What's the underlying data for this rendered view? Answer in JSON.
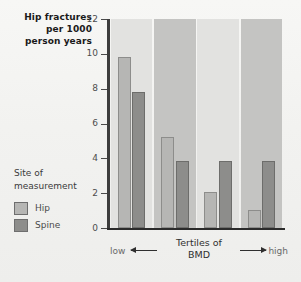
{
  "chart_data": {
    "type": "bar",
    "title": "Hip fractures per 1000 person years",
    "title_lines": [
      "Hip fractures",
      "per 1000",
      "person years"
    ],
    "categories": [
      "1",
      "2",
      "3",
      "4"
    ],
    "series": [
      {
        "name": "Hip",
        "values": [
          9.8,
          5.2,
          2.05,
          1.05
        ],
        "color": "#b6b6b4"
      },
      {
        "name": "Spine",
        "values": [
          7.8,
          3.85,
          3.85,
          3.85
        ],
        "color": "#8d8d8b"
      }
    ],
    "ylabel": "Hip fractures per 1000 person years",
    "ylim": [
      0,
      12
    ],
    "yticks": [
      0,
      2,
      4,
      6,
      8,
      10,
      12
    ],
    "ytick_labels": [
      "0",
      "2",
      "4",
      "6",
      "8",
      "10",
      "12"
    ],
    "xlabel": "Tertiles of BMD",
    "xlabel_lines": [
      "Tertiles of",
      "BMD"
    ],
    "x_axis_low_label": "low",
    "x_axis_high_label": "high",
    "grid": false,
    "legend_position": "left",
    "legend_title_lines": [
      "Site of",
      "measurement"
    ],
    "legend_entries": [
      {
        "label": "Hip",
        "color": "#b6b6b4"
      },
      {
        "label": "Spine",
        "color": "#8d8d8b"
      }
    ],
    "background_bands": [
      "#e2e2e0",
      "#c4c4c2",
      "#e2e2e0",
      "#c4c4c2"
    ]
  }
}
